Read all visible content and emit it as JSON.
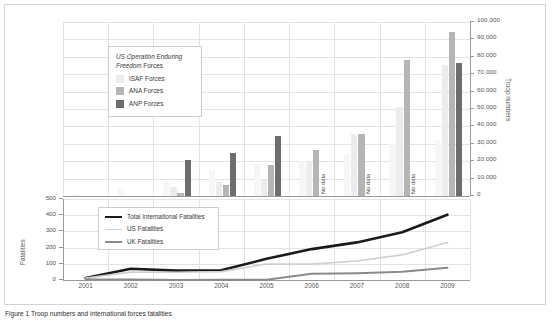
{
  "figure": {
    "caption": "Figure 1 Troop numbers and international forces fatalities"
  },
  "bar_legend": {
    "title_line1": "US Operation Enduring",
    "title_line2": "Freedom Forces",
    "items": [
      {
        "label": "ISAF Forces",
        "color": "#ececec"
      },
      {
        "label": "ANA Forces",
        "color": "#b5b5b5"
      },
      {
        "label": "ANP Forces",
        "color": "#6d6d6d"
      }
    ]
  },
  "line_legend": {
    "items": [
      {
        "label": "Total International Fatalities",
        "color": "#1a1a1a",
        "width": "2.6px"
      },
      {
        "label": "US Fatalities",
        "color": "#cfcfcf",
        "width": "1.6px"
      },
      {
        "label": "UK Fatalities",
        "color": "#8a8a8a",
        "width": "2px"
      }
    ]
  },
  "axes": {
    "right_title": "Troop numbers",
    "left_title": "Fatalities",
    "right_ticks": [
      "100,000",
      "90,000",
      "80,000",
      "70,000",
      "60,000",
      "50,000",
      "40,000",
      "30,000",
      "20,000",
      "10,000",
      "0"
    ],
    "left_ticks": [
      "500",
      "400",
      "300",
      "200",
      "100",
      "0"
    ],
    "no_data_label": "No data"
  },
  "chart_data": {
    "type": "bar",
    "title": "",
    "subtitle": "",
    "xlabel": "",
    "categories": [
      "2001",
      "2002",
      "2003",
      "2004",
      "2005",
      "2006",
      "2007",
      "2008",
      "2009"
    ],
    "grid": true,
    "legend_position": "inside-top-left",
    "panels": [
      {
        "panel": "troops",
        "type": "bar",
        "ylabel": "Troop numbers",
        "ylim": [
          0,
          100000
        ],
        "ytick_step": 10000,
        "series": [
          {
            "name": "US Operation Enduring Freedom Forces",
            "color": "#f6f6f6",
            "values": [
              1300,
              4000,
              8000,
              15000,
              19000,
              20000,
              23500,
              30000,
              32000
            ]
          },
          {
            "name": "ISAF Forces",
            "color": "#ececec",
            "values": [
              0,
              0,
              5000,
              8000,
              9000,
              20000,
              35500,
              51000,
              75500
            ]
          },
          {
            "name": "ANA Forces",
            "color": "#b5b5b5",
            "values": [
              0,
              0,
              1800,
              6500,
              18000,
              26500,
              35500,
              78000,
              94000
            ]
          },
          {
            "name": "ANP Forces",
            "color": "#6d6d6d",
            "values": [
              0,
              0,
              20500,
              24500,
              34500,
              null,
              null,
              null,
              76500
            ],
            "no_data_years": [
              "2006",
              "2007",
              "2008"
            ]
          }
        ]
      },
      {
        "panel": "fatalities",
        "type": "line",
        "ylabel": "Fatalities",
        "ylim": [
          0,
          500
        ],
        "ytick_step": 100,
        "series": [
          {
            "name": "Total International Fatalities",
            "color": "#1a1a1a",
            "width": 2.6,
            "values": [
              12,
              70,
              58,
              60,
              131,
              191,
              232,
              295,
              403
            ]
          },
          {
            "name": "US Fatalities",
            "color": "#cfcfcf",
            "width": 1.6,
            "values": [
              12,
              49,
              48,
              52,
              99,
              98,
              117,
              155,
              231
            ]
          },
          {
            "name": "UK Fatalities",
            "color": "#8a8a8a",
            "width": 2.0,
            "values": [
              3,
              3,
              0,
              1,
              1,
              39,
              42,
              51,
              75
            ]
          }
        ]
      }
    ]
  }
}
